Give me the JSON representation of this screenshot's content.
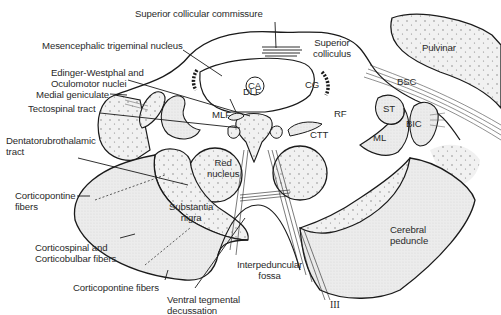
{
  "diagram": {
    "colors": {
      "line": "#1a1a1a",
      "stipple_fill": "#ececec",
      "dense_fill": "#e2e2e2",
      "background": "#ffffff"
    },
    "labels": {
      "superior_collicular_commissure": "Superior collicular commissure",
      "mesencephalic_trigeminal_nucleus": "Mesencephalic trigeminal nucleus",
      "edinger_westphal": "Edinger-Westphal and\nOculomotor nuclei",
      "medial_geniculate": "Medial geniculate",
      "tectospinal_tract": "Tectospinal tract",
      "dentatorubrothalamic_tract": "Dentatorubrothalamic\ntract",
      "corticopontine_fibers_upper": "Corticopontine\nfibers",
      "corticospinal_corticobulbar": "Corticospinal and\nCorticobulbar fibers",
      "corticopontine_fibers_lower": "Corticopontine fibers",
      "ventral_tegmental_decussation": "Ventral tegmental\ndecussation",
      "interpeduncular_fossa": "Interpeduncular\nfossa",
      "cerebral_peduncle": "Cerebral\npeduncle",
      "substantia_nigra": "Substantia\nnigra",
      "red_nucleus": "Red\nnucleus",
      "superior_colliculus": "Superior\ncolliculus",
      "pulvinar": "Pulvinar",
      "bsc": "BSC",
      "bic": "BIC",
      "st": "ST",
      "ml": "ML",
      "rf": "RF",
      "ctt": "CTT",
      "mlf": "MLF",
      "dlf": "DLF",
      "ca": "CA",
      "cg": "CG",
      "oculomotor_nerve": "III"
    }
  }
}
